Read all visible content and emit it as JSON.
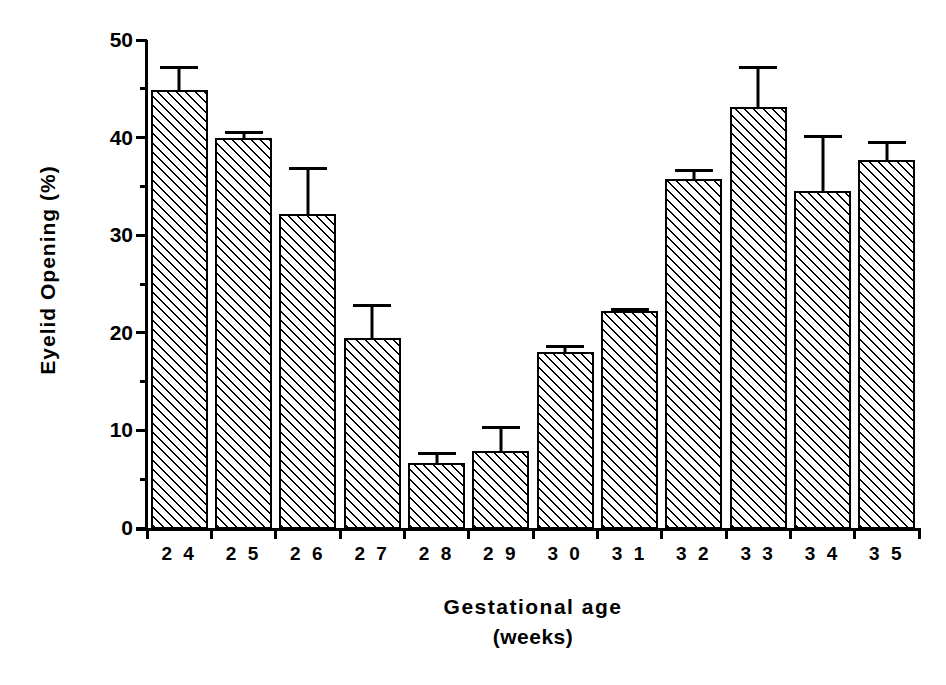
{
  "chart_data": {
    "type": "bar",
    "title": "",
    "xlabel": "Gestational age",
    "xlabel_line2": "(weeks)",
    "ylabel": "Eyelid Opening (%)",
    "categories": [
      "2 4",
      "2 5",
      "2 6",
      "2 7",
      "2 8",
      "2 9",
      "3 0",
      "3 1",
      "3 2",
      "3 3",
      "3 4",
      "3 5"
    ],
    "category_values": [
      24,
      25,
      26,
      27,
      28,
      29,
      30,
      31,
      32,
      33,
      34,
      35
    ],
    "values": [
      44.9,
      40.0,
      32.2,
      19.5,
      6.7,
      7.9,
      18.0,
      22.2,
      35.8,
      43.1,
      34.5,
      37.7
    ],
    "errors_upper": [
      47.3,
      40.7,
      37.0,
      23.0,
      7.8,
      10.4,
      18.7,
      22.5,
      36.8,
      47.3,
      40.3,
      39.7
    ],
    "error_magnitudes": [
      2.4,
      0.7,
      4.8,
      3.5,
      1.1,
      2.5,
      0.7,
      0.3,
      1.0,
      4.2,
      5.8,
      2.0
    ],
    "ylim": [
      0,
      50
    ],
    "ytick_labels": [
      "0",
      "10",
      "20",
      "30",
      "40",
      "50"
    ],
    "ytick_values": [
      0,
      10,
      20,
      30,
      40,
      50
    ],
    "yminor_values": [
      5,
      15,
      25,
      35,
      45
    ],
    "grid": false,
    "legend": null,
    "bar_fill": "hatched-45-diagonal",
    "bar_edge_color": "#000000",
    "background_color": "#ffffff"
  }
}
